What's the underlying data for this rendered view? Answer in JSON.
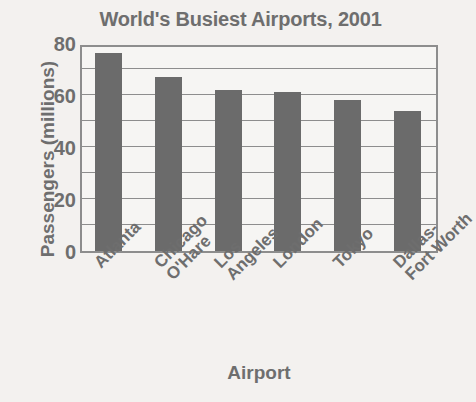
{
  "chart_data": {
    "type": "bar",
    "title": "World's Busiest Airports, 2001",
    "xlabel": "Airport",
    "ylabel": "Passengers (millions)",
    "categories": [
      "Atlanta",
      "Chicago O'Hare",
      "Los Angeles",
      "London",
      "Tokyo",
      "Dallas-Fort Worth"
    ],
    "category_lines": [
      [
        "Atlanta"
      ],
      [
        "Chicago",
        "O'Hare"
      ],
      [
        "Los",
        "Angeles"
      ],
      [
        "London"
      ],
      [
        "Tokyo"
      ],
      [
        "Dallas-",
        "Fort Worth"
      ]
    ],
    "values": [
      76,
      67,
      62,
      61,
      58,
      54
    ],
    "ylim": [
      0,
      80
    ],
    "ytick_labels": [
      "80",
      "60",
      "40",
      "20",
      "0"
    ],
    "ytick_values": [
      80,
      60,
      40,
      20,
      0
    ],
    "gridline_values": [
      70,
      60,
      50,
      40,
      30,
      20,
      10
    ],
    "grid": true,
    "legend": "none",
    "bar_color": "#6b6b6b",
    "text_color": "#6e6e6e",
    "axis_color": "#8d8d8d",
    "background_color": "#f3f1ef"
  }
}
